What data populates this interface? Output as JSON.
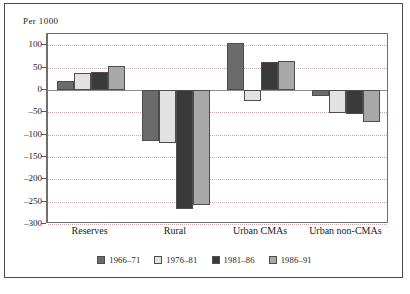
{
  "chart_data": {
    "type": "bar",
    "title": "",
    "subtitle": "",
    "xlabel": "",
    "ylabel": "Per 1000",
    "unit_label": "Per 1000",
    "categories": [
      "Reserves",
      "Rural",
      "Urban CMAs",
      "Urban non-CMAs"
    ],
    "series": [
      {
        "name": "1966–71",
        "color": "#6b6b6b",
        "values": [
          20,
          -114,
          105,
          -13
        ]
      },
      {
        "name": "1976–81",
        "color": "#e2e2e2",
        "values": [
          37,
          -118,
          -26,
          -52
        ]
      },
      {
        "name": "1981–86",
        "color": "#3a3a3a",
        "values": [
          40,
          -266,
          62,
          -55
        ]
      },
      {
        "name": "1986–91",
        "color": "#a8a8a8",
        "values": [
          53,
          -258,
          64,
          -72
        ]
      }
    ],
    "ylim": [
      -300,
      125
    ],
    "yticks": [
      100,
      50,
      0,
      -50,
      -100,
      -150,
      -200,
      -250,
      -300
    ],
    "ytick_labels": [
      "100",
      "50",
      "0",
      "–50",
      "–100",
      "–150",
      "–200",
      "–250",
      "–300"
    ],
    "grid": true,
    "grid_style": "dotted",
    "grid_color": "#c9a9a9",
    "zero_line": 0,
    "legend_position": "bottom",
    "frame": true
  },
  "legend": {
    "items": [
      {
        "label": "1966–71",
        "color": "#6b6b6b"
      },
      {
        "label": "1976–81",
        "color": "#e2e2e2"
      },
      {
        "label": "1981–86",
        "color": "#3a3a3a"
      },
      {
        "label": "1986–91",
        "color": "#a8a8a8"
      }
    ]
  },
  "caption": {
    "text": ""
  }
}
